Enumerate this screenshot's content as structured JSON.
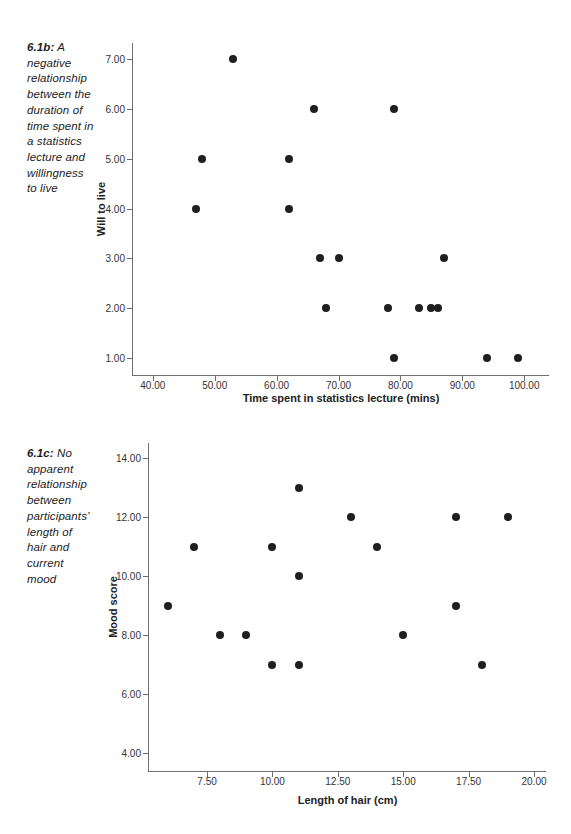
{
  "page": {
    "background": "#ffffff"
  },
  "figures": [
    {
      "name": "figure-6.1b",
      "caption": {
        "prefix": "6.1b:",
        "lines": [
          "A",
          "negative",
          "relationship",
          "between the",
          "duration of",
          "time spent in",
          "a statistics",
          "lecture and",
          "willingness",
          "to live"
        ]
      },
      "chart_data": {
        "type": "scatter",
        "title": "",
        "xlabel": "Time spent in statistics lecture (mins)",
        "ylabel": "Will to live",
        "xlim": [
          36.8,
          104.0
        ],
        "ylim": [
          0.66,
          7.32
        ],
        "grid": false,
        "marker_color": "#1f1f1f",
        "axis_color": "#6f6f6f",
        "x_ticks": {
          "values": [
            40,
            50,
            60,
            70,
            80,
            90,
            100
          ],
          "labels": [
            "40.00",
            "50.00",
            "60.00",
            "70.00",
            "80.00",
            "90.00",
            "100.00"
          ]
        },
        "y_ticks": {
          "values": [
            1,
            2,
            3,
            4,
            5,
            6,
            7
          ],
          "labels": [
            "1.00",
            "2.00",
            "3.00",
            "4.00",
            "5.00",
            "6.00",
            "7.00"
          ]
        },
        "points": [
          [
            47,
            4
          ],
          [
            48,
            5
          ],
          [
            53,
            7
          ],
          [
            62,
            5
          ],
          [
            62,
            4
          ],
          [
            66,
            6
          ],
          [
            67,
            3
          ],
          [
            68,
            2
          ],
          [
            70,
            3
          ],
          [
            78,
            2
          ],
          [
            79,
            6
          ],
          [
            79,
            1
          ],
          [
            83,
            2
          ],
          [
            85,
            2
          ],
          [
            86,
            2
          ],
          [
            87,
            3
          ],
          [
            94,
            1
          ],
          [
            99,
            1
          ]
        ]
      }
    },
    {
      "name": "figure-6.1c",
      "caption": {
        "prefix": "6.1c:",
        "lines": [
          "No",
          "apparent",
          "relationship",
          "between",
          "participants’",
          "length of",
          "hair and",
          "current",
          "mood"
        ]
      },
      "chart_data": {
        "type": "scatter",
        "title": "",
        "xlabel": "Length of hair (cm)",
        "ylabel": "Mood score",
        "xlim": [
          5.28,
          20.46
        ],
        "ylim": [
          3.39,
          14.51
        ],
        "grid": false,
        "marker_color": "#1f1f1f",
        "axis_color": "#6f6f6f",
        "x_ticks": {
          "values": [
            7.5,
            10,
            12.5,
            15,
            17.5,
            20
          ],
          "labels": [
            "7.50",
            "10.00",
            "12.50",
            "15.00",
            "17.50",
            "20.00"
          ]
        },
        "y_ticks": {
          "values": [
            4,
            6,
            8,
            10,
            12,
            14
          ],
          "labels": [
            "4.00",
            "6.00",
            "8.00",
            "10.00",
            "12.00",
            "14.00"
          ]
        },
        "points": [
          [
            6,
            9
          ],
          [
            7,
            11
          ],
          [
            8,
            8
          ],
          [
            9,
            8
          ],
          [
            10,
            11
          ],
          [
            10,
            7
          ],
          [
            11,
            13
          ],
          [
            11,
            10
          ],
          [
            11,
            7
          ],
          [
            13,
            12
          ],
          [
            14,
            11
          ],
          [
            15,
            8
          ],
          [
            17,
            12
          ],
          [
            17,
            9
          ],
          [
            18,
            7
          ],
          [
            19,
            12
          ]
        ]
      }
    }
  ]
}
